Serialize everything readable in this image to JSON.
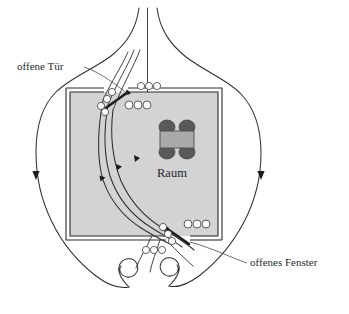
{
  "figure": {
    "kind": "airflow-diagram",
    "labels": {
      "door": "offene Tür",
      "window": "offenes Fenster",
      "room": "Raum"
    },
    "colors": {
      "room_fill": "#d3d3d3",
      "wall_stroke": "#2a2a2a",
      "streamline": "#2f2f33",
      "table_fill": "#a9a9a9",
      "chair_fill": "#595959",
      "background": "#ffffff",
      "label_text": "#2b2b2b"
    },
    "furniture": {
      "table_name": "table",
      "chair_count": 4
    },
    "features": [
      {
        "name": "open-door",
        "position": "top-left wall",
        "label": "offene Tür"
      },
      {
        "name": "open-window",
        "position": "bottom-right wall",
        "label": "offenes Fenster"
      },
      {
        "name": "interior-streamlines",
        "count": 3
      },
      {
        "name": "exterior-streamlines",
        "count": 2
      },
      {
        "name": "vortex-spirals",
        "count": 2
      },
      {
        "name": "eddy-chains",
        "count": 4
      }
    ]
  }
}
